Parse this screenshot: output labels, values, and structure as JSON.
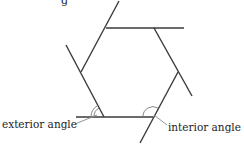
{
  "diagram": {
    "type": "hexagon-angles",
    "title_fragment": "g",
    "labels": {
      "exterior": "exterior angle",
      "interior": "interior angle"
    },
    "colors": {
      "line": "#3a3a3a",
      "arc": "#777777",
      "text": "#222222",
      "background": "#ffffff"
    }
  }
}
